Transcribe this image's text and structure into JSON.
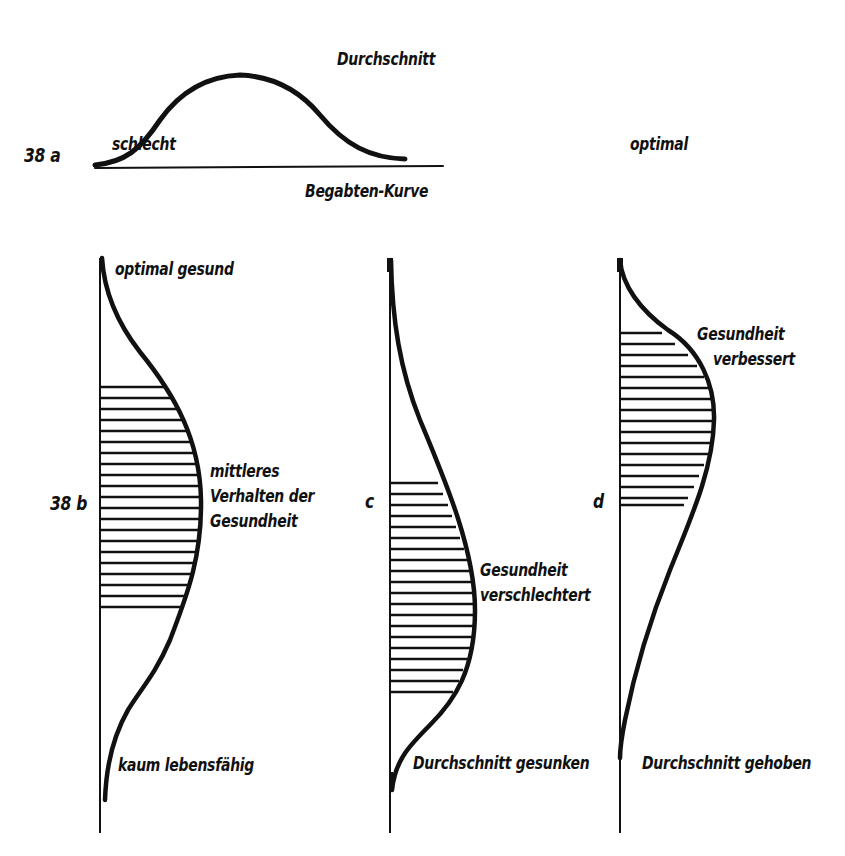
{
  "figure_38a": {
    "number": "38 a",
    "peak_label": "Durchschnitt",
    "left_label": "schlecht",
    "right_label": "optimal",
    "caption": "Begabten-Kurve"
  },
  "figure_38b": {
    "number": "38 b",
    "top_label": "optimal gesund",
    "middle_label": [
      "mittleres",
      "Verhalten der",
      "Gesundheit"
    ],
    "bottom_label": "kaum lebensfähig"
  },
  "figure_38c": {
    "number": "c",
    "middle_label": [
      "Gesundheit",
      "verschlechtert"
    ],
    "bottom_label": "Durchschnitt gesunken"
  },
  "figure_38d": {
    "number": "d",
    "middle_label": [
      "Gesundheit",
      "verbessert"
    ],
    "bottom_label": "Durchschnitt gehoben"
  },
  "colors": {
    "ink": "#111111",
    "paper": "#ffffff"
  }
}
